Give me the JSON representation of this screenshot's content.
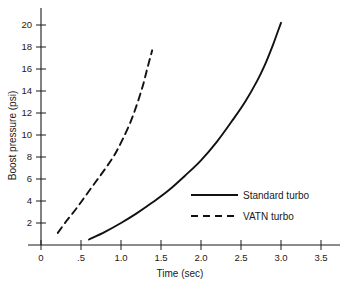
{
  "chart_data": {
    "type": "line",
    "title": "",
    "xlabel": "Time (sec)",
    "ylabel": "Boost pressure (psi)",
    "xlim": [
      0,
      3.5
    ],
    "ylim": [
      0,
      21
    ],
    "grid": false,
    "legend_position": "inside-right",
    "xticks": [
      "0",
      ".5",
      "1.0",
      "1.5",
      "2.0",
      "2.5",
      "3.0",
      "3.5"
    ],
    "xtick_values": [
      0,
      0.5,
      1.0,
      1.5,
      2.0,
      2.5,
      3.0,
      3.5
    ],
    "yticks": [
      "2",
      "4",
      "6",
      "8",
      "10",
      "12",
      "14",
      "16",
      "18",
      "20"
    ],
    "ytick_values": [
      2,
      4,
      6,
      8,
      10,
      12,
      14,
      16,
      18,
      20
    ],
    "series": [
      {
        "name": "Standard turbo",
        "style": "solid",
        "color": "#111111",
        "x": [
          0.6,
          0.8,
          1.0,
          1.2,
          1.4,
          1.6,
          1.8,
          2.0,
          2.2,
          2.4,
          2.55,
          2.7,
          2.8,
          2.9,
          2.95,
          3.0
        ],
        "y": [
          0.5,
          1.2,
          2.0,
          2.9,
          3.9,
          5.0,
          6.3,
          7.7,
          9.4,
          11.4,
          13.0,
          14.9,
          16.4,
          18.2,
          19.2,
          20.2
        ]
      },
      {
        "name": "VATN turbo",
        "style": "dashed",
        "color": "#111111",
        "x": [
          0.21,
          0.32,
          0.44,
          0.56,
          0.68,
          0.8,
          0.92,
          1.02,
          1.12,
          1.2,
          1.27,
          1.32,
          1.36,
          1.39
        ],
        "y": [
          1.1,
          2.2,
          3.3,
          4.5,
          5.7,
          6.9,
          8.2,
          9.6,
          11.2,
          12.8,
          14.4,
          15.8,
          16.9,
          17.7
        ]
      }
    ]
  },
  "legend": {
    "items": [
      {
        "label": "Standard turbo",
        "style": "solid"
      },
      {
        "label": "VATN turbo",
        "style": "dashed"
      }
    ]
  }
}
